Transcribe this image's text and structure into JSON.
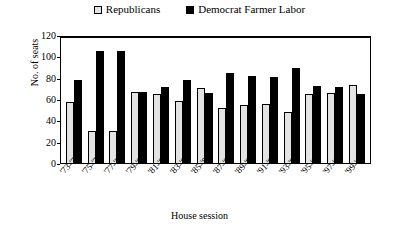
{
  "chart_data": {
    "type": "bar",
    "title": "",
    "xlabel": "House session",
    "ylabel": "No. of seats",
    "ylim": [
      0,
      120
    ],
    "yticks": [
      0,
      20,
      40,
      60,
      80,
      100,
      120
    ],
    "grid": false,
    "legend_position": "top-center",
    "categories": [
      "'73-'74",
      "'75-'76",
      "'77-'78",
      "'79-'80",
      "'81-'82",
      "'83-'84",
      "'85-'86",
      "'87-'88",
      "'89-'90",
      "'91-'92",
      "'93-'94",
      "'95-'96",
      "'97-'98",
      "'99-'00"
    ],
    "series": [
      {
        "name": "Republicans",
        "color": "#e3e3e3",
        "values": [
          57,
          30,
          30,
          67,
          65,
          58,
          70,
          52,
          54,
          55,
          48,
          65,
          66,
          73
        ]
      },
      {
        "name": "Democrat Farmer Labor",
        "color": "#000000",
        "values": [
          78,
          105,
          105,
          67,
          71,
          78,
          66,
          84,
          82,
          81,
          89,
          72,
          71,
          65
        ]
      }
    ]
  },
  "legend": {
    "entries": [
      {
        "label": "Republicans",
        "swatch": "light-square-icon"
      },
      {
        "label": "Democrat Farmer Labor",
        "swatch": "dark-square-icon"
      }
    ]
  }
}
